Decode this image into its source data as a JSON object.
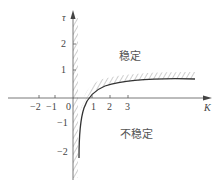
{
  "diagram": {
    "type": "stability-region-plot",
    "axes": {
      "x": {
        "label": "K",
        "ticks": [
          "-2",
          "-1",
          "0",
          "1",
          "2",
          "3"
        ]
      },
      "y": {
        "label": "τ",
        "ticks": [
          "2",
          "1",
          "-1",
          "-2"
        ]
      }
    },
    "regions": {
      "stable": "稳定",
      "unstable": "不稳定"
    },
    "colors": {
      "axis": "#555555",
      "curve": "#333333",
      "hatch": "#777777"
    }
  }
}
